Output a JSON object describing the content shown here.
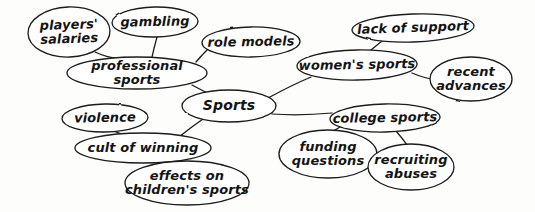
{
  "diagram": {
    "type": "concept-map",
    "style": "hand-drawn-ink",
    "canvas": {
      "width": 535,
      "height": 212
    },
    "colors": {
      "background": "#fdfdfc",
      "ink": "#1a1a1a",
      "bubble_fill": "#ffffff"
    },
    "nodes": [
      {
        "id": "players-salaries",
        "label": "players'\nsalaries",
        "cx": 69,
        "cy": 32,
        "rx": 41,
        "ry": 25,
        "font_size": 13,
        "rotate": -2,
        "shape": "ellipse"
      },
      {
        "id": "gambling",
        "label": "gambling",
        "cx": 155,
        "cy": 22,
        "rx": 43,
        "ry": 15,
        "font_size": 13,
        "rotate": -1,
        "shape": "ellipse"
      },
      {
        "id": "role-models",
        "label": "role models",
        "cx": 251,
        "cy": 42,
        "rx": 49,
        "ry": 15,
        "font_size": 13,
        "rotate": -1,
        "shape": "ellipse"
      },
      {
        "id": "lack-of-support",
        "label": "lack of support",
        "cx": 413,
        "cy": 28,
        "rx": 61,
        "ry": 14,
        "font_size": 13,
        "rotate": -2,
        "shape": "ellipse"
      },
      {
        "id": "professional-sports",
        "label": "professional sports",
        "cx": 137,
        "cy": 73,
        "rx": 70,
        "ry": 16,
        "font_size": 13,
        "rotate": 0,
        "shape": "ellipse"
      },
      {
        "id": "womens-sports",
        "label": "women's sports",
        "cx": 357,
        "cy": 65,
        "rx": 60,
        "ry": 15,
        "font_size": 13,
        "rotate": -1,
        "shape": "ellipse"
      },
      {
        "id": "recent-advances",
        "label": "recent\nadvances",
        "cx": 471,
        "cy": 79,
        "rx": 41,
        "ry": 22,
        "font_size": 13,
        "rotate": 0,
        "shape": "ellipse"
      },
      {
        "id": "sports",
        "label": "Sports",
        "cx": 229,
        "cy": 106,
        "rx": 47,
        "ry": 16,
        "font_size": 14,
        "rotate": 0,
        "shape": "ellipse"
      },
      {
        "id": "violence",
        "label": "violence",
        "cx": 105,
        "cy": 118,
        "rx": 43,
        "ry": 14,
        "font_size": 13,
        "rotate": -1,
        "shape": "ellipse"
      },
      {
        "id": "college-sports",
        "label": "college sports",
        "cx": 385,
        "cy": 118,
        "rx": 55,
        "ry": 14,
        "font_size": 13,
        "rotate": -1,
        "shape": "ellipse"
      },
      {
        "id": "cult-of-winning",
        "label": "cult of winning",
        "cx": 143,
        "cy": 148,
        "rx": 68,
        "ry": 15,
        "font_size": 13,
        "rotate": 0,
        "shape": "ellipse"
      },
      {
        "id": "funding-questions",
        "label": "funding\nquestions",
        "cx": 328,
        "cy": 154,
        "rx": 49,
        "ry": 24,
        "font_size": 13,
        "rotate": 0,
        "shape": "ellipse"
      },
      {
        "id": "recruiting-abuses",
        "label": "recruiting\nabuses",
        "cx": 411,
        "cy": 167,
        "rx": 43,
        "ry": 23,
        "font_size": 13,
        "rotate": 0,
        "shape": "ellipse"
      },
      {
        "id": "effects-childrens-sports",
        "label": "effects on\nchildren's sports",
        "cx": 187,
        "cy": 183,
        "rx": 62,
        "ry": 22,
        "font_size": 13,
        "rotate": 0,
        "shape": "ellipse"
      }
    ],
    "edges": [
      {
        "id": "edge-players-salaries-professional-sports",
        "from": "players-salaries",
        "to": "professional-sports",
        "path": "M 95 52 Q 110 59 122 58"
      },
      {
        "id": "edge-gambling-professional-sports",
        "from": "gambling",
        "to": "professional-sports",
        "path": "M 157 37 Q 154 48 152 57"
      },
      {
        "id": "edge-role-models-professional-sports",
        "from": "role-models",
        "to": "professional-sports",
        "path": "M 207 50 Q 201 56 196 62"
      },
      {
        "id": "edge-professional-sports-sports",
        "from": "professional-sports",
        "to": "sports",
        "path": "M 192 85 Q 205 92 214 96"
      },
      {
        "id": "edge-sports-womens-sports",
        "from": "sports",
        "to": "womens-sports",
        "path": "M 268 98 Q 292 85 311 77"
      },
      {
        "id": "edge-womens-sports-lack-of-support",
        "from": "womens-sports",
        "to": "lack-of-support",
        "path": "M 371 50 Q 380 42 391 35"
      },
      {
        "id": "edge-womens-sports-recent-advances",
        "from": "womens-sports",
        "to": "recent-advances",
        "path": "M 412 73 Q 424 78 432 79"
      },
      {
        "id": "edge-sports-college-sports",
        "from": "sports",
        "to": "college-sports",
        "path": "M 272 114 Q 300 116 332 113"
      },
      {
        "id": "edge-college-sports-funding-questions",
        "from": "college-sports",
        "to": "funding-questions",
        "path": "M 340 127 Q 332 132 326 135"
      },
      {
        "id": "edge-college-sports-recruiting-abuses",
        "from": "college-sports",
        "to": "recruiting-abuses",
        "path": "M 396 131 Q 402 138 408 146"
      },
      {
        "id": "edge-sports-cult-of-winning",
        "from": "sports",
        "to": "cult-of-winning",
        "path": "M 203 119 Q 190 128 179 137"
      },
      {
        "id": "edge-violence-cult-of-winning",
        "from": "violence",
        "to": "cult-of-winning",
        "path": "M 113 131 Q 122 135 131 134"
      },
      {
        "id": "edge-cult-of-winning-effects",
        "from": "cult-of-winning",
        "to": "effects-childrens-sports",
        "path": "M 176 160 Q 190 166 200 163"
      }
    ]
  }
}
